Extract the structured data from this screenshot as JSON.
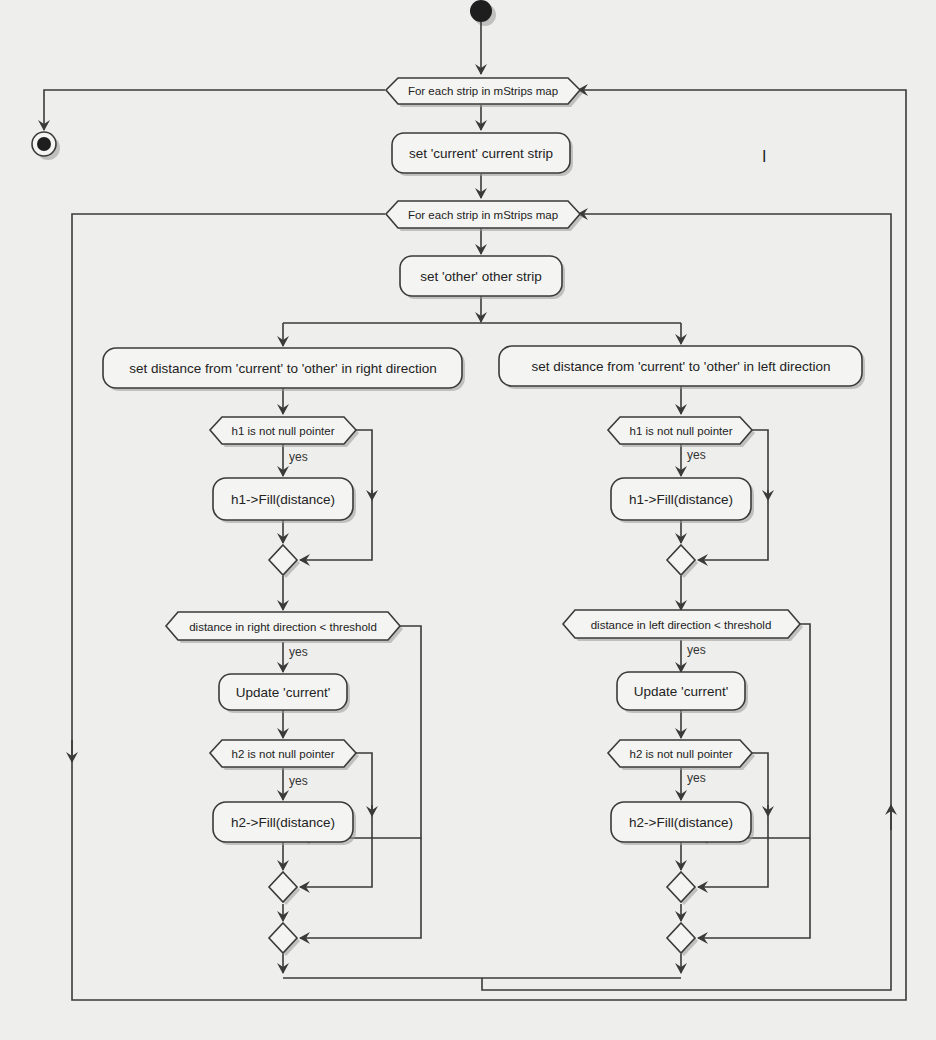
{
  "diagram": {
    "type": "activity-diagram",
    "start_node": "start",
    "end_node": "end",
    "outer_loop": {
      "label": "For each strip in mStrips map"
    },
    "set_current": {
      "label": "set 'current' current strip"
    },
    "inner_loop": {
      "label": "For each strip in mStrips map"
    },
    "set_other": {
      "label": "set 'other' other strip"
    },
    "right_branch": {
      "set_distance": "set distance from 'current' to 'other' in right direction",
      "h1_check": "h1 is not null pointer",
      "h1_yes": "yes",
      "h1_fill": "h1->Fill(distance)",
      "threshold_check": "distance in right direction < threshold",
      "threshold_yes": "yes",
      "update_current": "Update 'current'",
      "h2_check": "h2 is not null pointer",
      "h2_yes": "yes",
      "h2_fill": "h2->Fill(distance)"
    },
    "left_branch": {
      "set_distance": "set distance from 'current' to 'other' in left direction",
      "h1_check": "h1 is not null pointer",
      "h1_yes": "yes",
      "h1_fill": "h1->Fill(distance)",
      "threshold_check": "distance in left direction < threshold",
      "threshold_yes": "yes",
      "update_current": "Update 'current'",
      "h2_check": "h2 is not null pointer",
      "h2_yes": "yes",
      "h2_fill": "h2->Fill(distance)"
    },
    "stray_mark": "I"
  }
}
